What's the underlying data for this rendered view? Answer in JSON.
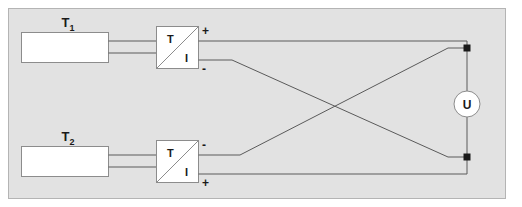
{
  "figure": {
    "type": "circuit-schematic",
    "background_color": "#ffffff",
    "panel_color": "#e2e2e2",
    "panel_border_color": "#b4b4b4",
    "wire_color": "#5a5a5a",
    "component_fill": "#ffffff",
    "component_border_color": "#8c8c8c",
    "text_color": "#1a1a1a"
  },
  "sensors": [
    {
      "id": "sensor-top",
      "label": "T",
      "subscript": "1"
    },
    {
      "id": "sensor-bottom",
      "label": "T",
      "subscript": "2"
    }
  ],
  "converters": [
    {
      "id": "converter-top",
      "input_label": "T",
      "output_label": "I",
      "terminal_upper": "+",
      "terminal_lower": "-"
    },
    {
      "id": "converter-bottom",
      "input_label": "T",
      "output_label": "I",
      "terminal_upper": "-",
      "terminal_lower": "+"
    }
  ],
  "meter": {
    "id": "voltmeter",
    "label": "U"
  }
}
